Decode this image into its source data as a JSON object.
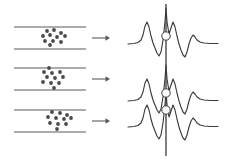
{
  "figure": {
    "width": 230,
    "height": 159,
    "background_color": "#ffffff",
    "stroke_color": "#5a5a5a",
    "trace_color": "#3b3b3b",
    "particle_color": "#4a4a4a",
    "panel_count": 3
  },
  "left_panels": [
    {
      "id": "channel-1",
      "label": "",
      "channel": {
        "x": 14,
        "y_top": 27,
        "y_bottom": 49,
        "width": 72,
        "wall_thickness": 1.2
      },
      "arrow": {
        "name": "flow-arrow",
        "x_start": 92,
        "x_end": 110,
        "y": 38,
        "direction": "right"
      },
      "particle_count": 11,
      "particles": [
        {
          "x": 47,
          "y": 31,
          "r": 1.9
        },
        {
          "x": 54,
          "y": 30,
          "r": 1.9
        },
        {
          "x": 61,
          "y": 33,
          "r": 1.9
        },
        {
          "x": 43,
          "y": 36,
          "r": 1.9
        },
        {
          "x": 50,
          "y": 35,
          "r": 1.9
        },
        {
          "x": 57,
          "y": 37,
          "r": 1.9
        },
        {
          "x": 65,
          "y": 36,
          "r": 1.9
        },
        {
          "x": 45,
          "y": 41,
          "r": 1.9
        },
        {
          "x": 53,
          "y": 41,
          "r": 1.9
        },
        {
          "x": 61,
          "y": 42,
          "r": 1.9
        },
        {
          "x": 50,
          "y": 45,
          "r": 1.9
        }
      ]
    },
    {
      "id": "channel-2",
      "label": "",
      "channel": {
        "x": 14,
        "y_top": 68,
        "y_bottom": 90,
        "width": 72,
        "wall_thickness": 1.2
      },
      "arrow": {
        "name": "flow-arrow",
        "x_start": 92,
        "x_end": 110,
        "y": 79,
        "direction": "right"
      },
      "particle_count": 11,
      "particles": [
        {
          "x": 49,
          "y": 68,
          "r": 1.9
        },
        {
          "x": 44,
          "y": 72,
          "r": 1.9
        },
        {
          "x": 52,
          "y": 73,
          "r": 1.9
        },
        {
          "x": 60,
          "y": 72,
          "r": 1.9
        },
        {
          "x": 47,
          "y": 77,
          "r": 1.9
        },
        {
          "x": 55,
          "y": 78,
          "r": 1.9
        },
        {
          "x": 63,
          "y": 77,
          "r": 1.9
        },
        {
          "x": 43,
          "y": 82,
          "r": 1.9
        },
        {
          "x": 51,
          "y": 83,
          "r": 1.9
        },
        {
          "x": 59,
          "y": 83,
          "r": 1.9
        },
        {
          "x": 54,
          "y": 88,
          "r": 1.9
        }
      ]
    },
    {
      "id": "channel-3",
      "label": "",
      "channel": {
        "x": 14,
        "y_top": 110,
        "y_bottom": 132,
        "width": 72,
        "wall_thickness": 1.2
      },
      "arrow": {
        "name": "flow-arrow",
        "x_start": 92,
        "x_end": 110,
        "y": 121,
        "direction": "right"
      },
      "particle_count": 11,
      "particles": [
        {
          "x": 52,
          "y": 112,
          "r": 1.9
        },
        {
          "x": 60,
          "y": 113,
          "r": 1.9
        },
        {
          "x": 67,
          "y": 115,
          "r": 1.9
        },
        {
          "x": 48,
          "y": 117,
          "r": 1.9
        },
        {
          "x": 56,
          "y": 118,
          "r": 1.9
        },
        {
          "x": 64,
          "y": 119,
          "r": 1.9
        },
        {
          "x": 71,
          "y": 118,
          "r": 1.9
        },
        {
          "x": 50,
          "y": 123,
          "r": 1.9
        },
        {
          "x": 58,
          "y": 124,
          "r": 1.9
        },
        {
          "x": 66,
          "y": 124,
          "r": 1.9
        },
        {
          "x": 57,
          "y": 129,
          "r": 1.9
        }
      ]
    }
  ],
  "right_panel": {
    "id": "signal-traces",
    "marker_line": {
      "name": "alignment-line",
      "x": 166,
      "y_top": 4,
      "y_bottom": 156
    },
    "markers": [
      {
        "name": "marker-node-1",
        "x": 166,
        "y": 36,
        "r": 4.2
      },
      {
        "name": "marker-node-2",
        "x": 166,
        "y": 93,
        "r": 4.2
      },
      {
        "name": "marker-node-3",
        "x": 166,
        "y": 110,
        "r": 4.2
      }
    ],
    "traces": [
      {
        "id": "trace-1",
        "baseline_y": 45,
        "path": "M 128 44 L 134 43.5 L 138 42.5 L 141 40 L 143 35 L 145 26 L 147 22 L 149 27 L 151 36 L 153 43 L 155 48 L 157 53 L 159 56 L 161 52 L 163 40 L 165 22 L 166 8 L 167 22 L 169 34 L 171 28 L 173 22 L 175 27 L 177 36 L 179 44 L 181 50 L 183 55 L 185 57 L 187 52 L 189 44 L 191 38 L 193 35 L 195 37 L 197 40 L 200 42 L 204 43 L 210 43.5 L 218 43.5"
      },
      {
        "id": "trace-2",
        "baseline_y": 102,
        "path": "M 128 101 L 134 100.5 L 138 99.5 L 141 97 L 143 92 L 145 83 L 147 79 L 149 84 L 151 93 L 153 100 L 155 105 L 157 110 L 159 113 L 161 109 L 163 97 L 165 79 L 166 65 L 167 79 L 169 91 L 171 85 L 173 79 L 175 84 L 177 93 L 179 101 L 181 107 L 183 112 L 185 114 L 187 109 L 189 101 L 191 95 L 193 92 L 195 94 L 197 97 L 200 99 L 204 100 L 210 100.5 L 218 100.5"
      },
      {
        "id": "trace-3",
        "baseline_y": 128,
        "path": "M 128 127 L 134 126.5 L 138 125.5 L 141 123 L 143 118 L 145 109 L 147 105 L 149 110 L 151 119 L 153 126 L 155 131 L 157 136 L 159 139 L 161 135 L 163 123 L 165 105 L 166 91 L 167 105 L 169 117 L 171 111 L 173 105 L 175 110 L 177 119 L 179 127 L 181 133 L 183 138 L 185 140 L 187 135 L 189 127 L 191 121 L 193 118 L 195 120 L 197 123 L 200 125 L 204 126 L 210 126.5 L 218 126.5"
      }
    ]
  }
}
